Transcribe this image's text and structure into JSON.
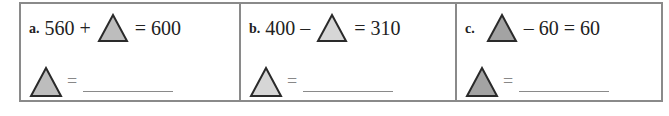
{
  "problems": [
    {
      "label": "a.",
      "before": "560 +",
      "after": "= 600",
      "triangle_color": "#bdbdbd",
      "answer_equals": "=",
      "answer_value": ""
    },
    {
      "label": "b.",
      "before": "400 –",
      "after": "= 310",
      "triangle_color": "#d6d6d6",
      "answer_equals": "=",
      "answer_value": ""
    },
    {
      "label": "c.",
      "before": "",
      "after": "– 60 = 60",
      "triangle_color": "#a3a3a3",
      "answer_equals": "=",
      "answer_value": ""
    }
  ],
  "colors": {
    "border": "#8a8a8a",
    "triangle_outline": "#2a2a2a"
  }
}
